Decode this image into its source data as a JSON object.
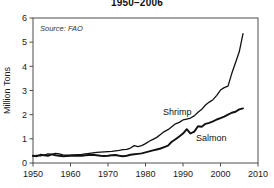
{
  "subtitle": "1950–2006",
  "annotation": "Source: FAO",
  "labels": {
    "shrimp": "Shrimp",
    "salmon": "Salmon",
    "ylabel": "Million Tons"
  },
  "colors": {
    "line": "#111111",
    "axis": "#4d4d4d",
    "background": "#ffffff",
    "text": "#1a1a1a"
  },
  "chart_data": {
    "type": "line",
    "title": "1950–2006",
    "xlabel": "",
    "ylabel": "Million Tons",
    "xlim": [
      1950,
      2010
    ],
    "ylim": [
      0,
      6
    ],
    "xticks": [
      1950,
      1960,
      1970,
      1980,
      1990,
      2000,
      2010
    ],
    "yticks": [
      0,
      1,
      2,
      3,
      4,
      5,
      6
    ],
    "grid": false,
    "legend": "inline-annotations",
    "annotations": [
      "Source: FAO"
    ],
    "x": [
      1950,
      1951,
      1952,
      1953,
      1954,
      1955,
      1956,
      1957,
      1958,
      1959,
      1960,
      1961,
      1962,
      1963,
      1964,
      1965,
      1966,
      1967,
      1968,
      1969,
      1970,
      1971,
      1972,
      1973,
      1974,
      1975,
      1976,
      1977,
      1978,
      1979,
      1980,
      1981,
      1982,
      1983,
      1984,
      1985,
      1986,
      1987,
      1988,
      1989,
      1990,
      1991,
      1992,
      1993,
      1994,
      1995,
      1996,
      1997,
      1998,
      1999,
      2000,
      2001,
      2002,
      2003,
      2004,
      2005,
      2006
    ],
    "series": [
      {
        "name": "Shrimp",
        "values": [
          0.28,
          0.32,
          0.3,
          0.33,
          0.38,
          0.36,
          0.4,
          0.38,
          0.34,
          0.33,
          0.33,
          0.34,
          0.35,
          0.36,
          0.38,
          0.4,
          0.42,
          0.44,
          0.45,
          0.46,
          0.47,
          0.48,
          0.5,
          0.52,
          0.55,
          0.56,
          0.62,
          0.72,
          0.68,
          0.72,
          0.8,
          0.9,
          0.98,
          1.06,
          1.18,
          1.3,
          1.38,
          1.5,
          1.62,
          1.68,
          1.78,
          1.82,
          1.86,
          1.95,
          2.1,
          2.22,
          2.4,
          2.52,
          2.62,
          2.8,
          3.02,
          3.12,
          3.18,
          3.7,
          4.15,
          4.6,
          5.35
        ]
      },
      {
        "name": "Salmon",
        "values": [
          0.3,
          0.28,
          0.34,
          0.32,
          0.3,
          0.36,
          0.32,
          0.3,
          0.28,
          0.29,
          0.3,
          0.31,
          0.3,
          0.3,
          0.32,
          0.33,
          0.34,
          0.32,
          0.3,
          0.29,
          0.3,
          0.32,
          0.33,
          0.3,
          0.28,
          0.3,
          0.34,
          0.36,
          0.38,
          0.4,
          0.44,
          0.48,
          0.52,
          0.56,
          0.6,
          0.66,
          0.72,
          0.88,
          0.98,
          1.1,
          1.22,
          1.4,
          1.22,
          1.3,
          1.52,
          1.5,
          1.62,
          1.66,
          1.72,
          1.8,
          1.86,
          1.92,
          2.0,
          2.08,
          2.12,
          2.22,
          2.26
        ]
      }
    ]
  }
}
